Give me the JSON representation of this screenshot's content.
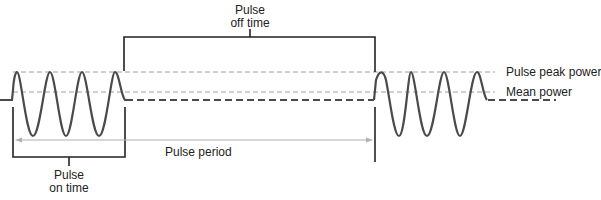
{
  "diagram": {
    "type": "pulsed-wave-timing",
    "labels": {
      "off_time_line1": "Pulse",
      "off_time_line2": "off time",
      "on_time_line1": "Pulse",
      "on_time_line2": "on time",
      "period": "Pulse period",
      "peak_power": "Pulse peak power",
      "mean_power": "Mean power"
    },
    "colors": {
      "waveform": "#4a4a4a",
      "bracket": "#222222",
      "reference_lines": "#9a9a9a",
      "period_arrow": "#b0b0b0",
      "text": "#222222"
    },
    "pulses": [
      {
        "name": "pulse-1",
        "cycles": 4
      },
      {
        "name": "pulse-2",
        "cycles": 3.5
      }
    ]
  }
}
